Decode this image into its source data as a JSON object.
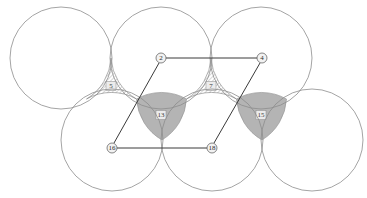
{
  "figure": {
    "background": "#ffffff",
    "width": 367,
    "height": 198,
    "circle_stroke": "#8d8d8d",
    "circle_fill": "#ffffff",
    "line_color": "#3a3a3a",
    "hatch_color": "#7d7d7d",
    "gray_fill": "#b4b4b4",
    "node_fill": "#f2f2f2",
    "node_stroke": "#555555"
  },
  "circles": [
    {
      "name": "circle-top-left",
      "cx": 61,
      "cy": 58,
      "r": 51
    },
    {
      "name": "circle-top-middle",
      "cx": 161,
      "cy": 58,
      "r": 51
    },
    {
      "name": "circle-top-right",
      "cx": 261,
      "cy": 58,
      "r": 51
    },
    {
      "name": "circle-bottom-left",
      "cx": 112,
      "cy": 140,
      "r": 51
    },
    {
      "name": "circle-bottom-middle",
      "cx": 212,
      "cy": 140,
      "r": 51
    },
    {
      "name": "circle-bottom-right",
      "cx": 312,
      "cy": 140,
      "r": 51
    }
  ],
  "regions": [
    {
      "name": "region-hatched-left",
      "label": "5",
      "style": "hatched",
      "lx": 111,
      "ly": 86
    },
    {
      "name": "region-hatched-right",
      "label": "7",
      "style": "hatched",
      "lx": 211,
      "ly": 86
    },
    {
      "name": "region-gray-left",
      "label": "13",
      "style": "solid",
      "lx": 161,
      "ly": 115
    },
    {
      "name": "region-gray-right",
      "label": "15",
      "style": "solid",
      "lx": 261,
      "ly": 115
    }
  ],
  "nodes": [
    {
      "name": "node-2",
      "label": "2",
      "cx": 161,
      "cy": 58,
      "r": 5
    },
    {
      "name": "node-4",
      "label": "4",
      "cx": 262,
      "cy": 58,
      "r": 5
    },
    {
      "name": "node-16",
      "label": "16",
      "cx": 112,
      "cy": 148,
      "r": 5
    },
    {
      "name": "node-18",
      "label": "18",
      "cx": 212,
      "cy": 148,
      "r": 5
    }
  ],
  "edges": [
    {
      "name": "edge-2-to-4",
      "from": "2",
      "to": "4",
      "x1": 166,
      "y1": 58,
      "x2": 257,
      "y2": 58
    },
    {
      "name": "edge-16-to-18",
      "from": "16",
      "to": "18",
      "x1": 117,
      "y1": 148,
      "x2": 207,
      "y2": 148
    },
    {
      "name": "edge-2-to-16",
      "from": "2",
      "to": "16",
      "x1": 159,
      "y1": 63,
      "x2": 114,
      "y2": 143
    },
    {
      "name": "edge-4-to-18",
      "from": "4",
      "to": "18",
      "x1": 260,
      "y1": 63,
      "x2": 214,
      "y2": 143
    }
  ]
}
